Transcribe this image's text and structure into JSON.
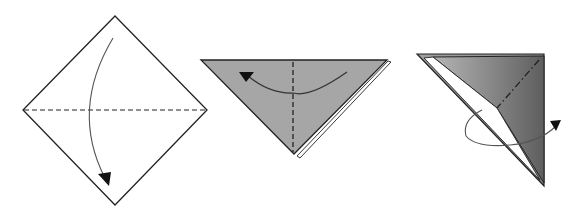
{
  "diagram": {
    "type": "origami-instructions",
    "steps": [
      {
        "index": 1,
        "shape": "square-diamond",
        "fold": "valley-fold-horizontal-diagonal",
        "arrow": "fold-top-down",
        "paper_color": "#ffffff"
      },
      {
        "index": 2,
        "shape": "triangle-point-down",
        "fold": "valley-fold-vertical-center",
        "arrow": "fold-right-to-left",
        "paper_color": "#a6a6a6"
      },
      {
        "index": 3,
        "shape": "right-triangle",
        "fold": "mountain-fold-dash-dot",
        "arrow": "turn-over",
        "paper_color": "#8f8f8f"
      }
    ],
    "colors": {
      "line": "#222222",
      "gray_light": "#a9a9a9",
      "gray_dark": "#6e6e6e",
      "arrow": "#555555"
    }
  }
}
